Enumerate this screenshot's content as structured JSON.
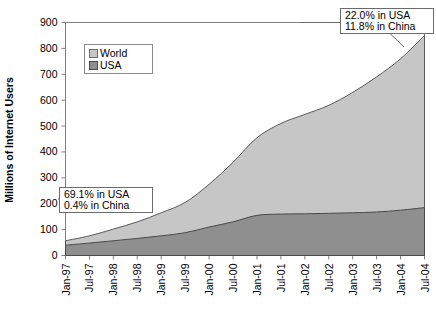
{
  "chart_data": {
    "type": "area",
    "title": "",
    "xlabel": "",
    "ylabel": "Millions of Internet Users",
    "ylim": [
      0,
      900
    ],
    "ytick_step": 100,
    "yticks": [
      "0",
      "100",
      "200",
      "300",
      "400",
      "500",
      "600",
      "700",
      "800",
      "900"
    ],
    "grid": false,
    "stacked": false,
    "legend_position": "top-left",
    "categories": [
      "Jan-97",
      "Jul-97",
      "Jan-98",
      "Jul-98",
      "Jan-99",
      "Jul-99",
      "Jan-00",
      "Jul-00",
      "Jan-01",
      "Jul-01",
      "Jan-02",
      "Jul-02",
      "Jan-03",
      "Jul-03",
      "Jan-04",
      "Jul-04"
    ],
    "series": [
      {
        "name": "World",
        "color": "#c6c6c6",
        "values": [
          57,
          76,
          102,
          130,
          165,
          205,
          275,
          360,
          455,
          510,
          545,
          580,
          630,
          690,
          760,
          850
        ]
      },
      {
        "name": "USA",
        "color": "#8f8f8f",
        "values": [
          40,
          48,
          57,
          66,
          76,
          88,
          110,
          130,
          155,
          160,
          161,
          163,
          165,
          168,
          175,
          185
        ]
      }
    ],
    "annotations": [
      {
        "id": "early-share",
        "lines": [
          "69.1% in USA",
          "0.4% in China"
        ],
        "anchor_category": "Jan-97"
      },
      {
        "id": "late-share",
        "lines": [
          "22.0% in USA",
          "11.8% in China"
        ],
        "anchor_category": "Jul-04"
      }
    ]
  }
}
